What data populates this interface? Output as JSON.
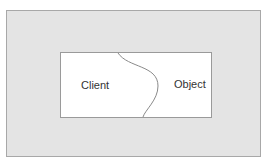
{
  "diagram": {
    "left_label": "Client",
    "right_label": "Object",
    "colors": {
      "outer_fill": "#e4e4e4",
      "inner_fill": "#ffffff",
      "line": "#8a8a8a",
      "text": "#333333"
    }
  }
}
